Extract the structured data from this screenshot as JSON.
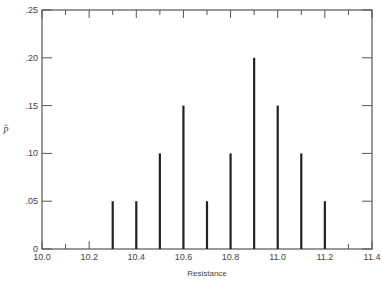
{
  "chart_data": {
    "type": "bar",
    "title": "",
    "xlabel": "Resistance",
    "ylabel": "p̂",
    "x": [
      10.3,
      10.4,
      10.5,
      10.6,
      10.7,
      10.8,
      10.9,
      11.0,
      11.1,
      11.2
    ],
    "values": [
      0.05,
      0.05,
      0.1,
      0.15,
      0.05,
      0.1,
      0.2,
      0.15,
      0.1,
      0.05
    ],
    "xlim": [
      10.0,
      11.4
    ],
    "ylim": [
      0,
      0.25
    ],
    "xticks": [
      "10.0",
      "10.2",
      "10.4",
      "10.6",
      "10.8",
      "11.0",
      "11.2",
      "11.4"
    ],
    "yticks": [
      "0",
      ".05",
      ".10",
      ".15",
      ".20",
      ".25"
    ],
    "grid": false,
    "legend": null,
    "bar_style": "thin vertical spikes"
  },
  "colors": {
    "bar": "#222222",
    "axis": "#555555",
    "text": "#444444"
  }
}
